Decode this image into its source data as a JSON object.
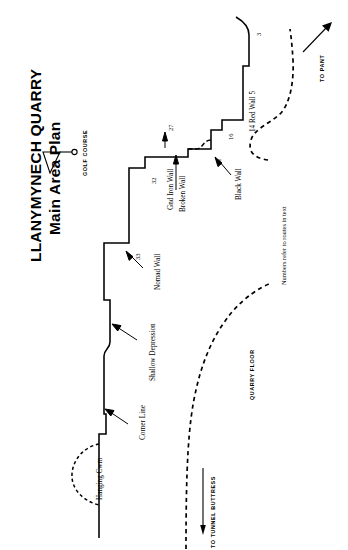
{
  "document": {
    "kind": "climbing-crag-topo-plan",
    "orientation_note": "all map text is rotated 90 degrees (reading bottom-to-top)"
  },
  "title": {
    "line1": "LLANYMYNECH QUARRY",
    "line2": "Main Area Plan"
  },
  "north_arrow": {
    "name": "north-arrow-symbol",
    "label": "N"
  },
  "area_labels": [
    {
      "id": "golf-course",
      "text": "GOLF COURSE"
    },
    {
      "id": "quarry-floor",
      "text": "QUARRY FLOOR"
    },
    {
      "id": "to-pant",
      "text": "TO PANT"
    },
    {
      "id": "to-tunnel-buttress",
      "text": "TO TUNNEL BUTTRESS"
    }
  ],
  "feature_labels": [
    {
      "id": "hanging-cwm",
      "text": "Hanging Cwm"
    },
    {
      "id": "corner-line",
      "text": "Corner Line"
    },
    {
      "id": "shallow-depression",
      "text": "Shallow Depression"
    },
    {
      "id": "nomad-wall",
      "text": "Nomad Wall"
    },
    {
      "id": "gnd-iron-wall",
      "text": "Gnd Iron Wall"
    },
    {
      "id": "broken-wall",
      "text": "Broken Wall"
    },
    {
      "id": "black-wall",
      "text": "Black Wall"
    },
    {
      "id": "red-wall",
      "text": "14  Red Wall  5"
    }
  ],
  "route_numbers": [
    {
      "id": "route-33",
      "text": "33"
    },
    {
      "id": "route-32",
      "text": "32"
    },
    {
      "id": "route-27",
      "text": "27"
    },
    {
      "id": "route-21",
      "text": "21"
    },
    {
      "id": "route-16",
      "text": "16"
    },
    {
      "id": "route-3",
      "text": "3"
    }
  ],
  "legend_note": {
    "text": "Numbers refer to routes in text"
  },
  "colors": {
    "ink": "#000000",
    "paper": "#ffffff"
  }
}
